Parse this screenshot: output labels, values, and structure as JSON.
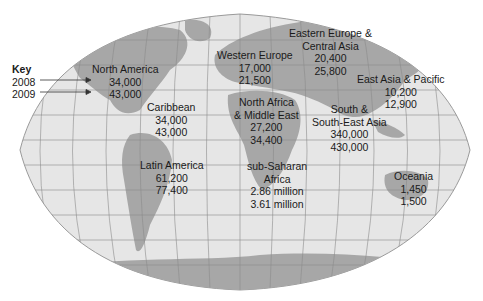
{
  "colors": {
    "ocean": "#e6e6e6",
    "land": "#a7a7a7",
    "grid": "#8c8c8c",
    "text": "#1a1a1a",
    "background": "#ffffff"
  },
  "key": {
    "title": "Key",
    "rows": [
      {
        "year": "2008"
      },
      {
        "year": "2009"
      }
    ]
  },
  "regions": [
    {
      "name_lines": [
        "North America"
      ],
      "v2008": "34,000",
      "v2009": "43,000"
    },
    {
      "name_lines": [
        "Caribbean"
      ],
      "v2008": "34,000",
      "v2009": "43,000"
    },
    {
      "name_lines": [
        "Latin America"
      ],
      "v2008": "61,200",
      "v2009": "77,400"
    },
    {
      "name_lines": [
        "Western Europe"
      ],
      "v2008": "17,000",
      "v2009": "21,500"
    },
    {
      "name_lines": [
        "Eastern Europe &",
        "Central Asia"
      ],
      "v2008": "20,400",
      "v2009": "25,800"
    },
    {
      "name_lines": [
        "East Asia & Pacific"
      ],
      "v2008": "10,200",
      "v2009": "12,900"
    },
    {
      "name_lines": [
        "North Africa",
        "& Middle East"
      ],
      "v2008": "27,200",
      "v2009": "34,400"
    },
    {
      "name_lines": [
        "South &",
        "South-East Asia"
      ],
      "v2008": "340,000",
      "v2009": "430,000"
    },
    {
      "name_lines": [
        "sub-Saharan",
        "Africa"
      ],
      "v2008": "2.86 million",
      "v2009": "3.61 million"
    },
    {
      "name_lines": [
        "Oceania"
      ],
      "v2008": "1,450",
      "v2009": "1,500"
    }
  ]
}
